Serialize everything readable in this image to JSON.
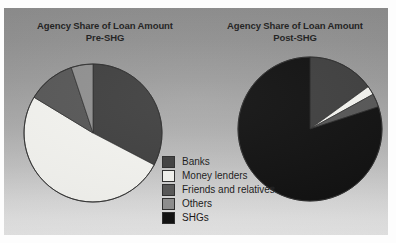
{
  "figure": {
    "background_color": "#fdfdfd",
    "panel_color": "#a0a0a0"
  },
  "legend": {
    "name": "chart-legend",
    "items": [
      {
        "label": "Banks",
        "color": "#3d3d3d"
      },
      {
        "label": "Money lenders",
        "color": "#f4f4f0"
      },
      {
        "label": "Friends and relatives",
        "color": "#555555"
      },
      {
        "label": "Others",
        "color": "#8f8f8f"
      },
      {
        "label": "SHGs",
        "color": "#0e0e0e"
      }
    ]
  },
  "charts": {
    "left": {
      "title_line1": "Agency Share of Loan Amount",
      "title_line2": "Pre-SHG"
    },
    "right": {
      "title_line1": "Agency Share of Loan Amount",
      "title_line2": "Post-SHG"
    }
  },
  "chart_data": [
    {
      "type": "pie",
      "title": "Agency Share of Loan Amount Pre-SHG",
      "subtitle": "Pre-SHG",
      "categories": [
        "Banks",
        "Money lenders",
        "Friends and relatives",
        "Others",
        "SHGs"
      ],
      "values": [
        32,
        50,
        11,
        5,
        0
      ],
      "units": "percent",
      "colors": [
        "#3d3d3d",
        "#f4f4f0",
        "#555555",
        "#8f8f8f",
        "#0e0e0e"
      ],
      "start_angle_deg": 0,
      "direction": "clockwise",
      "legend": "center",
      "grid": false
    },
    {
      "type": "pie",
      "title": "Agency Share of Loan Amount Post-SHG",
      "subtitle": "Post-SHG",
      "categories": [
        "Banks",
        "Money lenders",
        "Friends and relatives",
        "Others",
        "SHGs"
      ],
      "values": [
        15,
        2,
        3,
        0,
        80
      ],
      "units": "percent",
      "colors": [
        "#3d3d3d",
        "#f4f4f0",
        "#555555",
        "#8f8f8f",
        "#0e0e0e"
      ],
      "start_angle_deg": 0,
      "direction": "clockwise",
      "legend": "center",
      "grid": false
    }
  ]
}
